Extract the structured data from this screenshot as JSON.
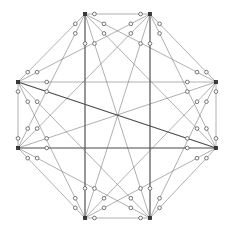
{
  "figure": {
    "background_color": "#ffffff"
  },
  "style": {
    "edge_color": "#6e6e6e",
    "edge_color_dark": "#4a4a4a",
    "edge_width": 0.55,
    "edge_width_dark": 1.15,
    "vertex_fill": "#3a3a3a",
    "vertex_stroke": "#2b2b2b",
    "vertex_size": 3.2,
    "dot_fill": "#ffffff",
    "dot_stroke": "#5f5f5f",
    "dot_radius": 1.85,
    "dot_offset_ratio": 0.145
  },
  "graph_data": {
    "type": "graph",
    "name": "K8",
    "vertex_count": 8,
    "edge_count": 28,
    "subdivisions_per_edge": 2,
    "total_subdivision_dots": 56,
    "layout": "regular-octagon",
    "center": {
      "x": 117,
      "y": 116
    },
    "circumradius": 103,
    "vertices": [
      {
        "id": 0,
        "label": "v0",
        "x": 85,
        "y": 14,
        "position": "top-left"
      },
      {
        "id": 1,
        "label": "v1",
        "x": 150,
        "y": 14,
        "position": "top-right"
      },
      {
        "id": 2,
        "label": "v2",
        "x": 216,
        "y": 82,
        "position": "right-top"
      },
      {
        "id": 3,
        "label": "v3",
        "x": 216,
        "y": 148,
        "position": "right-bottom"
      },
      {
        "id": 4,
        "label": "v4",
        "x": 150,
        "y": 218,
        "position": "bottom-right"
      },
      {
        "id": 5,
        "label": "v5",
        "x": 85,
        "y": 218,
        "position": "bottom-left"
      },
      {
        "id": 6,
        "label": "v6",
        "x": 18,
        "y": 148,
        "position": "left-bottom"
      },
      {
        "id": 7,
        "label": "v7",
        "x": 18,
        "y": 82,
        "position": "left-top"
      }
    ],
    "edges": [
      {
        "from": 0,
        "to": 1,
        "emphasis": "normal"
      },
      {
        "from": 0,
        "to": 2,
        "emphasis": "normal"
      },
      {
        "from": 0,
        "to": 3,
        "emphasis": "normal"
      },
      {
        "from": 0,
        "to": 4,
        "emphasis": "normal"
      },
      {
        "from": 0,
        "to": 5,
        "emphasis": "dark"
      },
      {
        "from": 0,
        "to": 6,
        "emphasis": "normal"
      },
      {
        "from": 0,
        "to": 7,
        "emphasis": "normal"
      },
      {
        "from": 1,
        "to": 2,
        "emphasis": "normal"
      },
      {
        "from": 1,
        "to": 3,
        "emphasis": "normal"
      },
      {
        "from": 1,
        "to": 4,
        "emphasis": "dark"
      },
      {
        "from": 1,
        "to": 5,
        "emphasis": "normal"
      },
      {
        "from": 1,
        "to": 6,
        "emphasis": "normal"
      },
      {
        "from": 1,
        "to": 7,
        "emphasis": "normal"
      },
      {
        "from": 2,
        "to": 3,
        "emphasis": "normal"
      },
      {
        "from": 2,
        "to": 4,
        "emphasis": "normal"
      },
      {
        "from": 2,
        "to": 5,
        "emphasis": "normal"
      },
      {
        "from": 2,
        "to": 6,
        "emphasis": "normal"
      },
      {
        "from": 2,
        "to": 7,
        "emphasis": "normal"
      },
      {
        "from": 3,
        "to": 4,
        "emphasis": "normal"
      },
      {
        "from": 3,
        "to": 5,
        "emphasis": "normal"
      },
      {
        "from": 3,
        "to": 6,
        "emphasis": "dark"
      },
      {
        "from": 3,
        "to": 7,
        "emphasis": "dark"
      },
      {
        "from": 4,
        "to": 5,
        "emphasis": "normal"
      },
      {
        "from": 4,
        "to": 6,
        "emphasis": "normal"
      },
      {
        "from": 4,
        "to": 7,
        "emphasis": "normal"
      },
      {
        "from": 5,
        "to": 6,
        "emphasis": "normal"
      },
      {
        "from": 5,
        "to": 7,
        "emphasis": "normal"
      },
      {
        "from": 6,
        "to": 7,
        "emphasis": "normal"
      }
    ]
  }
}
